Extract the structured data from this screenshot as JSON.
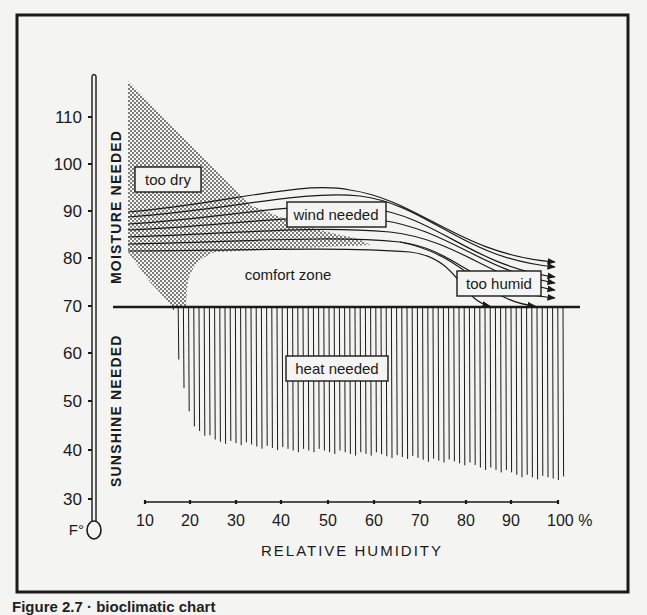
{
  "figure": {
    "caption": "Figure 2.7 · bioclimatic chart",
    "colors": {
      "ink": "#1a1a1a",
      "paper": "#f4f4f2",
      "stipple": "#555555"
    }
  },
  "chart_data": {
    "type": "diagram",
    "title": "Bioclimatic chart",
    "xlabel": "RELATIVE HUMIDITY",
    "ylabel": "F°",
    "x_unit": "%",
    "xlim": [
      10,
      100
    ],
    "ylim": [
      30,
      110
    ],
    "x_ticks": [
      "10",
      "20",
      "30",
      "40",
      "50",
      "60",
      "70",
      "80",
      "90",
      "100 %"
    ],
    "y_ticks": [
      "110",
      "100",
      "90",
      "80",
      "70",
      "60",
      "50",
      "40",
      "30"
    ],
    "y_axis_style": "thermometer",
    "side_labels": {
      "upper": "MOISTURE NEEDED",
      "lower": "SUNSHINE NEEDED"
    },
    "regions": [
      {
        "name": "too dry",
        "fill": "stipple",
        "polygon_rh_f": [
          [
            10,
            107
          ],
          [
            38,
            88
          ],
          [
            42,
            86
          ],
          [
            60,
            84
          ],
          [
            27,
            84
          ],
          [
            22,
            77
          ],
          [
            20,
            70
          ],
          [
            17,
            70
          ],
          [
            10,
            81
          ]
        ]
      },
      {
        "name": "wind needed",
        "style": "flow lines with arrows",
        "rh_start": 10,
        "rh_end": 100,
        "f_start_range": [
          82,
          90
        ],
        "f_end_range": [
          70,
          79
        ]
      },
      {
        "name": "comfort zone",
        "approx_rh": [
          20,
          80
        ],
        "approx_f": [
          70,
          82
        ]
      },
      {
        "name": "too humid",
        "approx_rh": [
          80,
          100
        ],
        "approx_f": [
          70,
          78
        ]
      },
      {
        "name": "heat needed",
        "style": "vertical hatching",
        "upper_f": 70,
        "lower_boundary_rh_f": [
          [
            16,
            70
          ],
          [
            17,
            60
          ],
          [
            20,
            45
          ],
          [
            25,
            42
          ],
          [
            40,
            40
          ],
          [
            60,
            39
          ],
          [
            80,
            37
          ],
          [
            95,
            34
          ],
          [
            100,
            34
          ]
        ]
      }
    ],
    "reference_lines": [
      {
        "f": 70,
        "rh_from": 6,
        "rh_to": 103,
        "label": ""
      }
    ],
    "labels": [
      "too dry",
      "wind needed",
      "comfort zone",
      "too humid",
      "heat needed"
    ]
  }
}
